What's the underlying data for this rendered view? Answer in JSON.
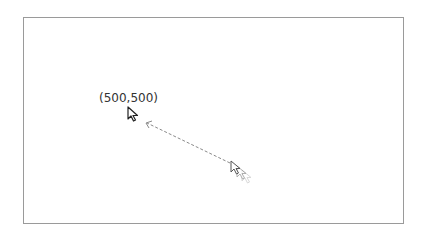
{
  "screen": {
    "description": "Mouse move action visualization",
    "target": {
      "coordinate_label": "(500,500)",
      "x": 500,
      "y": 500
    },
    "cursor_icons": {
      "target": "arrow-cursor-icon",
      "trail": "arrow-cursor-trail-icon"
    },
    "colors": {
      "frame_border": "#9a9a9a",
      "cursor_stroke": "#222222",
      "trail_stroke": "#555555",
      "trail_fade": "#aaaaaa",
      "path": "#8a8a8a",
      "label": "#333333"
    }
  }
}
